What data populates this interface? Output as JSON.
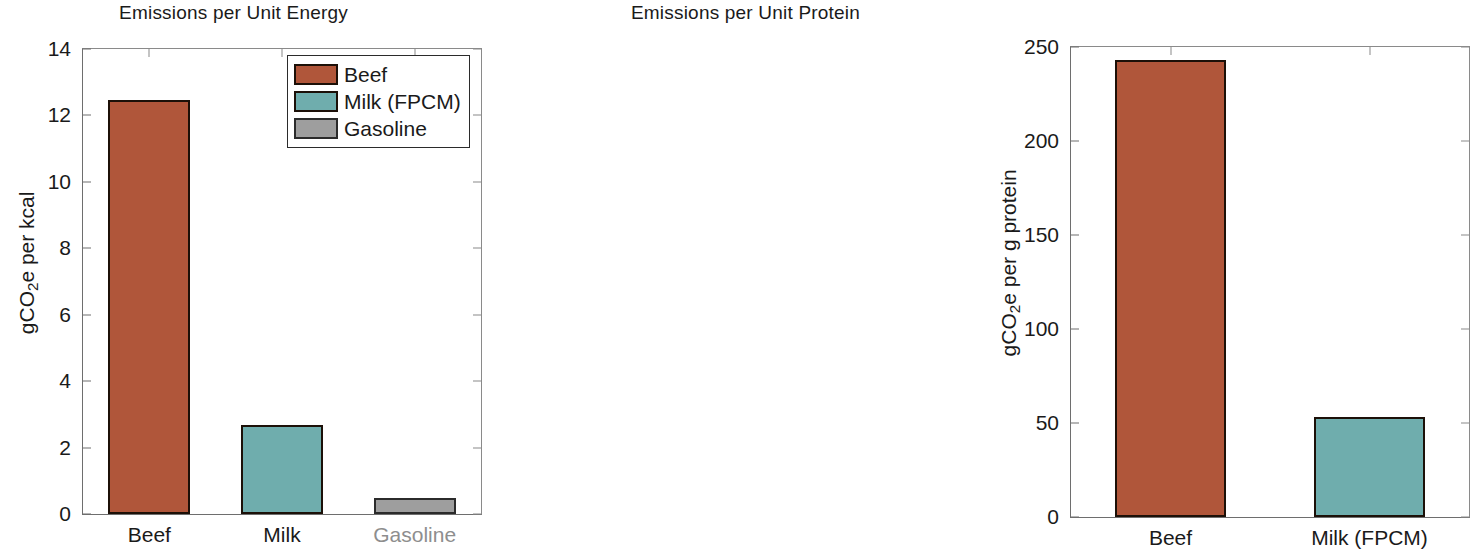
{
  "figure": {
    "background": "#ffffff",
    "colors": {
      "beef": "#b0563a",
      "milk": "#6fadad",
      "gasoline": "#9e9e9e",
      "axis": "#6e6e6e",
      "text": "#1a1a1a",
      "muted_text": "#8e8e8e"
    }
  },
  "chart_data": [
    {
      "type": "bar",
      "title": "Emissions per Unit Energy",
      "xlabel": "",
      "ylabel": "gCO2e per kcal",
      "ylabel_parts": {
        "pre": "gCO",
        "sub": "2",
        "post": "e per kcal"
      },
      "categories": [
        "Beef",
        "Milk",
        "Gasoline"
      ],
      "values": [
        12.45,
        2.68,
        0.48
      ],
      "ylim": [
        0,
        14
      ],
      "yticks": [
        0,
        2,
        4,
        6,
        8,
        10,
        12,
        14
      ],
      "ytick_labels": [
        "0",
        "2",
        "4",
        "6",
        "8",
        "10",
        "12",
        "14"
      ],
      "bar_colors": [
        "#b0563a",
        "#6fadad",
        "#9e9e9e"
      ],
      "grid": false,
      "legend": {
        "position": "top-right",
        "entries": [
          {
            "label": "Beef",
            "color": "#b0563a"
          },
          {
            "label": "Milk (FPCM)",
            "color": "#6fadad"
          },
          {
            "label": "Gasoline",
            "color": "#9e9e9e"
          }
        ]
      }
    },
    {
      "type": "bar",
      "title": "Emissions per Unit Protein",
      "xlabel": "",
      "ylabel": "gCO2e per g protein",
      "ylabel_parts": {
        "pre": "gCO",
        "sub": "2",
        "post": "e per g protein"
      },
      "categories": [
        "Beef",
        "Milk (FPCM)"
      ],
      "values": [
        243,
        53
      ],
      "ylim": [
        0,
        250
      ],
      "yticks": [
        0,
        50,
        100,
        150,
        200,
        250
      ],
      "ytick_labels": [
        "0",
        "50",
        "100",
        "150",
        "200",
        "250"
      ],
      "bar_colors": [
        "#b0563a",
        "#6fadad"
      ],
      "grid": false,
      "legend": null
    }
  ]
}
